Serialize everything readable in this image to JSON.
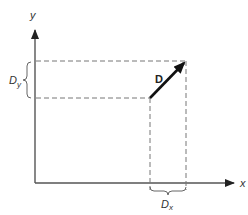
{
  "diagram": {
    "title": "",
    "axes": {
      "x_label": "x",
      "y_label": "y"
    },
    "vector": {
      "label": "D",
      "start": [
        150,
        98
      ],
      "end": [
        186,
        61
      ]
    },
    "components": {
      "dx_label_main": "D",
      "dx_label_sub": "x",
      "dy_label_main": "D",
      "dy_label_sub": "y"
    },
    "colors": {
      "axis": "#555555",
      "dashed": "#777777",
      "vector": "#111111",
      "background": "#ffffff"
    }
  }
}
